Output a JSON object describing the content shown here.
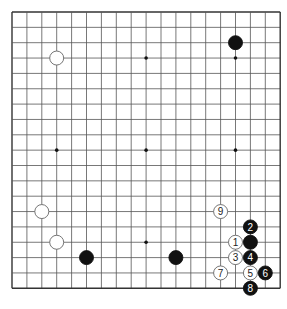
{
  "board": {
    "size": 19,
    "origin_x": 12,
    "origin_y": 12,
    "step_x": 14.9,
    "step_y": 15.35,
    "line_color": "#555555",
    "border_color": "#333333",
    "background": "#ffffff",
    "stone_radius": 7,
    "star_points": [
      [
        3,
        3
      ],
      [
        9,
        3
      ],
      [
        15,
        3
      ],
      [
        3,
        9
      ],
      [
        9,
        9
      ],
      [
        15,
        9
      ],
      [
        3,
        15
      ],
      [
        9,
        15
      ],
      [
        15,
        15
      ]
    ]
  },
  "stones": [
    {
      "color": "white",
      "col": 3,
      "row": 3,
      "label": ""
    },
    {
      "color": "black",
      "col": 15,
      "row": 2,
      "label": ""
    },
    {
      "color": "white",
      "col": 2,
      "row": 13,
      "label": ""
    },
    {
      "color": "white",
      "col": 3,
      "row": 15,
      "label": ""
    },
    {
      "color": "black",
      "col": 5,
      "row": 16,
      "label": ""
    },
    {
      "color": "black",
      "col": 11,
      "row": 16,
      "label": ""
    },
    {
      "color": "black",
      "col": 16,
      "row": 15,
      "label": ""
    },
    {
      "color": "white",
      "col": 15,
      "row": 15,
      "label": "1"
    },
    {
      "color": "black",
      "col": 16,
      "row": 14,
      "label": "2"
    },
    {
      "color": "white",
      "col": 15,
      "row": 16,
      "label": "3"
    },
    {
      "color": "black",
      "col": 16,
      "row": 16,
      "label": "4"
    },
    {
      "color": "white",
      "col": 16,
      "row": 17,
      "label": "5"
    },
    {
      "color": "black",
      "col": 17,
      "row": 17,
      "label": "6"
    },
    {
      "color": "white",
      "col": 14,
      "row": 17,
      "label": "7"
    },
    {
      "color": "black",
      "col": 16,
      "row": 18,
      "label": "8"
    },
    {
      "color": "white",
      "col": 14,
      "row": 13,
      "label": "9"
    }
  ]
}
